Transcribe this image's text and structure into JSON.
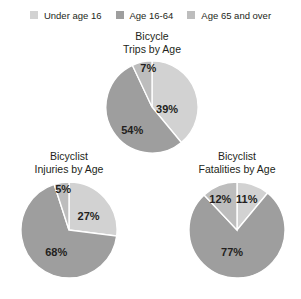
{
  "legend": {
    "items": [
      {
        "label": "Under age 16",
        "color": "#d2d2d2",
        "key": "under-age-16"
      },
      {
        "label": "Age 16-64",
        "color": "#9e9e9e",
        "key": "age-16-64"
      },
      {
        "label": "Age 65 and over",
        "color": "#bdbdbd",
        "key": "age-65-and-over"
      }
    ]
  },
  "charts": [
    {
      "id": "trips",
      "title_line1": "Bicycle",
      "title_line2": "Trips by Age",
      "labels": {
        "under16": "39%",
        "age16_64": "54%",
        "age65": "7%"
      }
    },
    {
      "id": "injuries",
      "title_line1": "Bicyclist",
      "title_line2": "Injuries by Age",
      "labels": {
        "under16": "27%",
        "age16_64": "68%",
        "age65": "5%"
      }
    },
    {
      "id": "fatalities",
      "title_line1": "Bicyclist",
      "title_line2": "Fatalities by Age",
      "labels": {
        "under16": "11%",
        "age16_64": "77%",
        "age65": "12%"
      }
    }
  ],
  "chart_data": [
    {
      "type": "pie",
      "title": "Bicycle Trips by Age",
      "categories": [
        "Under age 16",
        "Age 16-64",
        "Age 65 and over"
      ],
      "values": [
        39,
        54,
        7
      ],
      "colors": [
        "#d2d2d2",
        "#9e9e9e",
        "#bdbdbd"
      ],
      "units": "percent",
      "legend": "top",
      "start_angle_deg": 0,
      "direction": "clockwise"
    },
    {
      "type": "pie",
      "title": "Bicyclist Injuries by Age",
      "categories": [
        "Under age 16",
        "Age 16-64",
        "Age 65 and over"
      ],
      "values": [
        27,
        68,
        5
      ],
      "colors": [
        "#d2d2d2",
        "#9e9e9e",
        "#bdbdbd"
      ],
      "units": "percent",
      "legend": "top",
      "start_angle_deg": 0,
      "direction": "clockwise"
    },
    {
      "type": "pie",
      "title": "Bicyclist Fatalities by Age",
      "categories": [
        "Under age 16",
        "Age 16-64",
        "Age 65 and over"
      ],
      "values": [
        11,
        77,
        12
      ],
      "colors": [
        "#d2d2d2",
        "#9e9e9e",
        "#bdbdbd"
      ],
      "units": "percent",
      "legend": "top",
      "start_angle_deg": 0,
      "direction": "clockwise"
    }
  ]
}
